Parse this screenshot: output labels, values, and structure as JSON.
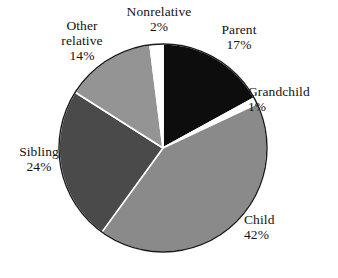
{
  "chart_data": {
    "type": "pie",
    "title": "",
    "subtitle": "",
    "xlabel": "",
    "ylabel": "",
    "legend_position": "none",
    "grid": false,
    "value_unit": "%",
    "start_angle_deg": 0,
    "direction": "clockwise",
    "categories": [
      "Parent",
      "Grandchild",
      "Child",
      "Sibling",
      "Other relative",
      "Nonrelative"
    ],
    "values": [
      17,
      1,
      42,
      24,
      14,
      2
    ],
    "colors": [
      "#0d0d0d",
      "#ffffff",
      "#8a8a8a",
      "#4a4a4a",
      "#949494",
      "#ffffff"
    ],
    "slices": [
      {
        "name": "Parent",
        "value": 17,
        "label_name": "Parent",
        "label_value": "17%",
        "color": "#0d0d0d",
        "start_deg": 0,
        "end_deg": 61.2
      },
      {
        "name": "Grandchild",
        "value": 1,
        "label_name": "Grandchild",
        "label_value": "1%",
        "color": "#ffffff",
        "start_deg": 61.2,
        "end_deg": 64.8
      },
      {
        "name": "Child",
        "value": 42,
        "label_name": "Child",
        "label_value": "42%",
        "color": "#8a8a8a",
        "start_deg": 64.8,
        "end_deg": 216.0
      },
      {
        "name": "Sibling",
        "value": 24,
        "label_name": "Sibling",
        "label_value": "24%",
        "color": "#4a4a4a",
        "start_deg": 216.0,
        "end_deg": 302.4
      },
      {
        "name": "Other relative",
        "value": 14,
        "label_name_line1": "Other",
        "label_name_line2": "relative",
        "label_value": "14%",
        "color": "#949494",
        "start_deg": 302.4,
        "end_deg": 352.8
      },
      {
        "name": "Nonrelative",
        "value": 2,
        "label_name": "Nonrelative",
        "label_value": "2%",
        "color": "#ffffff",
        "start_deg": 352.8,
        "end_deg": 360.0
      }
    ],
    "geometry": {
      "center_x": 163,
      "center_y": 148,
      "radius": 104,
      "outline_color": "#1a1a1a",
      "separator_color": "#ffffff",
      "background": "#ffffff"
    }
  }
}
